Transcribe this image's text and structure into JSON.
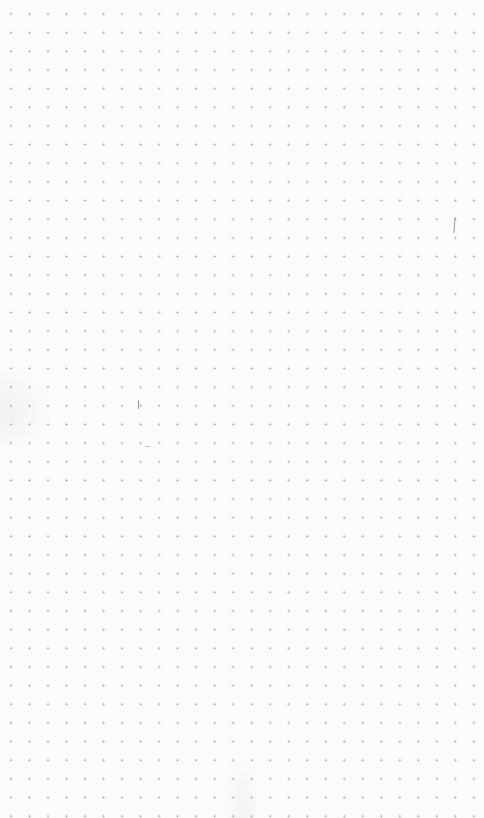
{
  "scene": {
    "description": "Dot-grid paper sheet",
    "background_color": "#fbfbfa",
    "dot_color": "#b8b8b8",
    "dot_spacing_px": [
      18.52,
      18.67
    ],
    "columns": 26,
    "rows": 42
  },
  "marks": [
    {
      "name": "pencil-stroke-right",
      "x": 454,
      "y": 217,
      "w": 1.2,
      "h": 16
    },
    {
      "name": "pencil-stroke-center",
      "x": 138,
      "y": 400,
      "w": 1,
      "h": 9
    },
    {
      "name": "pencil-smudge-center",
      "x": 145,
      "y": 446,
      "w": 5,
      "h": 1.2
    }
  ]
}
